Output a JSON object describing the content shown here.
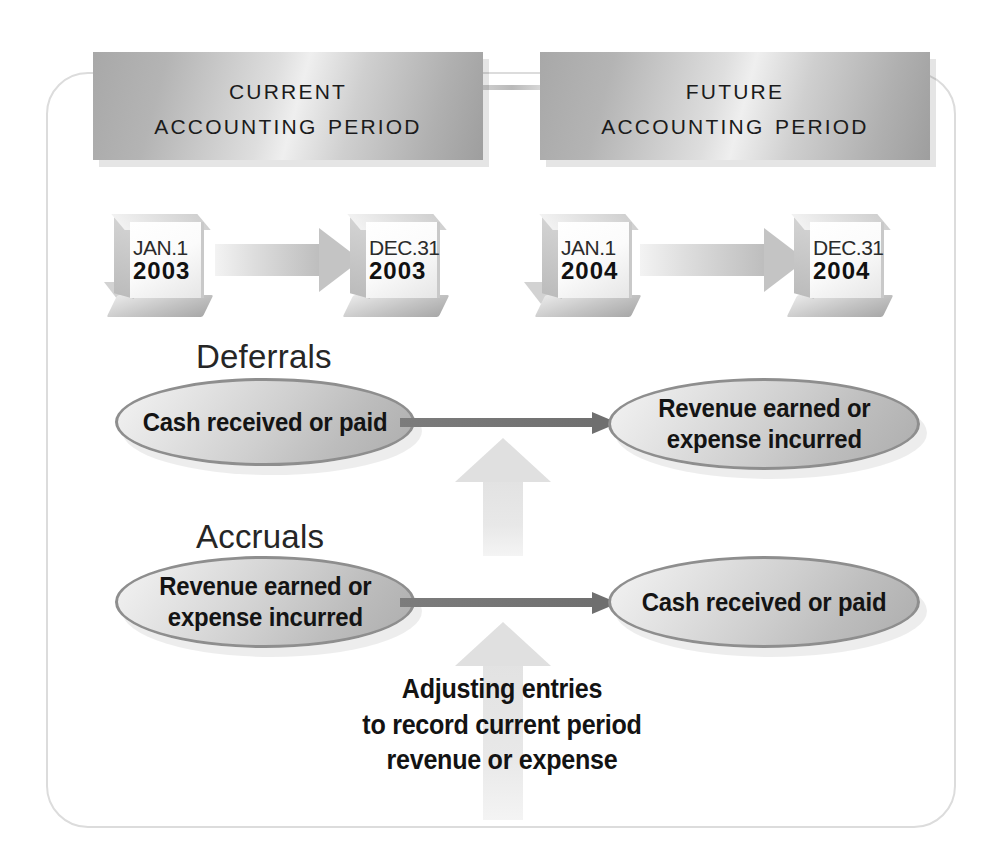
{
  "colors": {
    "banner_gray": "#c0c0c0",
    "ellipse_fill": "#cfcfcf",
    "ellipse_border": "#8e8e8e",
    "arrow_dark": "#6f6f6f",
    "arrow_pale": "#e2e2e2",
    "frame_border": "#dcdcdc",
    "text_dark": "#131313"
  },
  "banners": {
    "current": {
      "line1": "Current",
      "line2": "Accounting Period"
    },
    "future": {
      "line1": "Future",
      "line2": "Accounting Period"
    }
  },
  "calendars": [
    {
      "name": "jan-2003",
      "month_day": "JAN.1",
      "year": "2003"
    },
    {
      "name": "dec-2003",
      "month_day": "DEC.31",
      "year": "2003"
    },
    {
      "name": "jan-2004",
      "month_day": "JAN.1",
      "year": "2004"
    },
    {
      "name": "dec-2004",
      "month_day": "DEC.31",
      "year": "2004"
    }
  ],
  "sections": {
    "deferrals": {
      "label": "Deferrals",
      "left_text_line1": "Cash received or paid",
      "right_text_line1": "Revenue earned or",
      "right_text_line2": "expense incurred"
    },
    "accruals": {
      "label": "Accruals",
      "left_text_line1": "Revenue earned or",
      "left_text_line2": "expense incurred",
      "right_text_line1": "Cash received or paid"
    }
  },
  "caption": {
    "line1": "Adjusting entries",
    "line2": "to record current period",
    "line3": "revenue or expense"
  }
}
